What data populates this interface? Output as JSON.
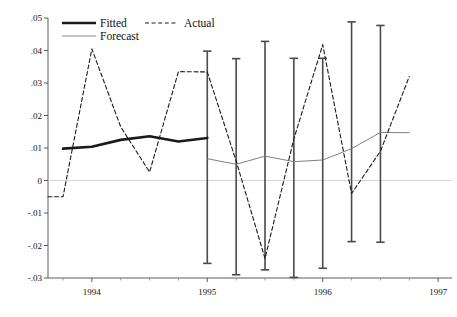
{
  "chart_data": {
    "type": "line",
    "title": "",
    "subtitle": "",
    "xlabel": "",
    "ylabel": "",
    "xlim": [
      1993.62,
      1997.12
    ],
    "ylim": [
      -0.03,
      0.05
    ],
    "grid": false,
    "zero_line": true,
    "legend_position": "top-left",
    "x_tick_labels": [
      "1994",
      "1995",
      "1996",
      "1997"
    ],
    "x_tick_values": [
      1994,
      1995,
      1996,
      1997
    ],
    "x_minor_ticks": [
      1993.75,
      1994.25,
      1994.5,
      1994.75,
      1995.25,
      1995.5,
      1995.75,
      1996.25,
      1996.5,
      1996.75
    ],
    "y_tick_labels": [
      ".05",
      ".04",
      ".03",
      ".02",
      ".01",
      "0",
      "-.01",
      "-.02",
      "-.03"
    ],
    "y_tick_values": [
      0.05,
      0.04,
      0.03,
      0.02,
      0.01,
      0,
      -0.01,
      -0.02,
      -0.03
    ],
    "series": [
      {
        "name": "Fitted",
        "style": "solid-thick-black",
        "color": "#1a1a1a",
        "x": [
          1993.75,
          1994.0,
          1994.25,
          1994.5,
          1994.75,
          1995.0
        ],
        "values": [
          0.0098,
          0.0104,
          0.0125,
          0.0136,
          0.012,
          0.0131
        ]
      },
      {
        "name": "Actual",
        "style": "dashed-black",
        "color": "#1a1a1a",
        "x": [
          1993.62,
          1993.75,
          1994.0,
          1994.25,
          1994.5,
          1994.75,
          1995.0,
          1995.25,
          1995.5,
          1995.75,
          1996.0,
          1996.25,
          1996.5,
          1996.75
        ],
        "values": [
          -0.005,
          -0.005,
          0.0405,
          0.0165,
          0.0026,
          0.0335,
          0.0334,
          0.006,
          -0.024,
          0.0128,
          0.0418,
          -0.004,
          0.009,
          0.032
        ]
      },
      {
        "name": "Forecast",
        "style": "solid-thin-gray",
        "color": "#808080",
        "x": [
          1995.0,
          1995.25,
          1995.5,
          1995.75,
          1996.0,
          1996.25,
          1996.5,
          1996.75
        ],
        "values": [
          0.0067,
          0.005,
          0.0075,
          0.0058,
          0.0063,
          0.0098,
          0.0148,
          0.0147
        ]
      }
    ],
    "error_bars": {
      "name": "Forecast confidence interval",
      "color": "#4a4a4a",
      "x": [
        1995.0,
        1995.25,
        1995.5,
        1995.75,
        1996.0,
        1996.25,
        1996.5,
        1996.75
      ],
      "upper": [
        0.0398,
        0.0375,
        0.0428,
        0.0376,
        0.0376,
        0.0488,
        0.0477
      ],
      "lower": [
        -0.0255,
        -0.029,
        -0.0275,
        -0.0298,
        -0.027,
        -0.0188,
        -0.019
      ],
      "x_positions": [
        1995.0,
        1995.25,
        1995.5,
        1995.75,
        1996.0,
        1996.25,
        1996.5
      ]
    }
  },
  "legend": {
    "items": [
      {
        "label": "Fitted",
        "style": "solid-thick-black"
      },
      {
        "label": "Actual",
        "style": "dashed-black"
      },
      {
        "label": "Forecast",
        "style": "solid-thin-gray"
      }
    ]
  }
}
